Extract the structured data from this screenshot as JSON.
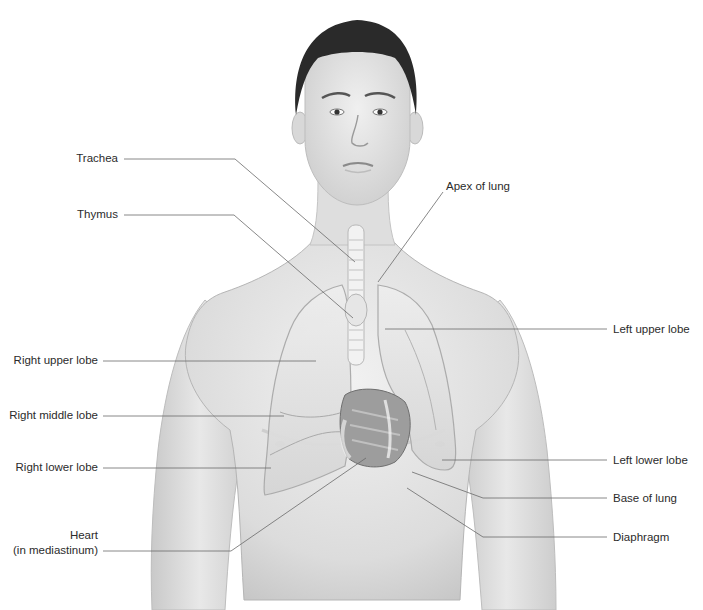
{
  "diagram": {
    "colors": {
      "label_text": "#2b2b2b",
      "leader_line": "#6a6a6a",
      "skin_light": "#ececec",
      "skin_mid": "#d4d4d4",
      "skin_shadow": "#b9b9b9",
      "hair": "#2a2a2a",
      "lung": "#e2e2e2",
      "lung_edge": "#a9a9a9",
      "heart": "#8f8f8f",
      "trachea": "#f2f2f2"
    },
    "labels_left": [
      {
        "id": "trachea",
        "text": "Trachea"
      },
      {
        "id": "thymus",
        "text": "Thymus"
      },
      {
        "id": "right-upper-lobe",
        "text": "Right upper lobe"
      },
      {
        "id": "right-middle-lobe",
        "text": "Right middle lobe"
      },
      {
        "id": "right-lower-lobe",
        "text": "Right lower lobe"
      },
      {
        "id": "heart",
        "text": "Heart",
        "subtext": "(in mediastinum)"
      }
    ],
    "labels_right": [
      {
        "id": "apex-of-lung",
        "text": "Apex of lung"
      },
      {
        "id": "left-upper-lobe",
        "text": "Left upper lobe"
      },
      {
        "id": "left-lower-lobe",
        "text": "Left lower lobe"
      },
      {
        "id": "base-of-lung",
        "text": "Base of lung"
      },
      {
        "id": "diaphragm",
        "text": "Diaphragm"
      }
    ]
  }
}
